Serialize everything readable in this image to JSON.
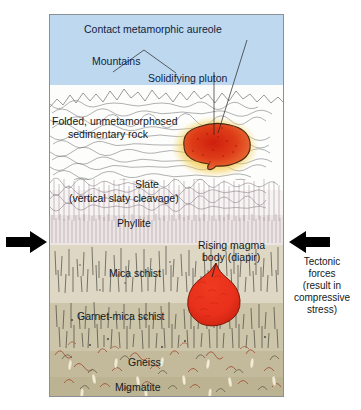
{
  "figure": {
    "type": "geology-cross-section",
    "title_present": false,
    "background_color": "#ffffff",
    "frame_color": "#8a8f96"
  },
  "colors": {
    "sky": "#bed9ef",
    "sedimentary": "#fdfdfb",
    "slate": "#f6f3f2",
    "phyllite": "#ece5e4",
    "mica_schist": "#ded7c4",
    "garnet_mica_schist": "#cdc5a9",
    "gneiss": "#c3ba9b",
    "migmatite": "#bcb392",
    "pluton_core": "#d62a16",
    "pluton_rim": "#e8642a",
    "aureole_halo": "#f2c230",
    "diapir": "#e8301b",
    "text": "#14181c",
    "label_blue": "#10233f",
    "arrow": "#000000"
  },
  "sky_labels": [
    {
      "id": "contact-aureole",
      "text": "Contact metamorphic aureole"
    },
    {
      "id": "mountains",
      "text": "Mountains"
    },
    {
      "id": "solidifying-pluton",
      "text": "Solidifying pluton"
    }
  ],
  "rock_labels": [
    {
      "id": "folded-sed-l1",
      "text": "Folded, unmetamorphosed"
    },
    {
      "id": "folded-sed-l2",
      "text": "sedimentary rock"
    },
    {
      "id": "slate",
      "text": "Slate"
    },
    {
      "id": "slaty-cleavage",
      "text": "(vertical slaty cleavage)"
    },
    {
      "id": "phyllite",
      "text": "Phyllite"
    },
    {
      "id": "mica-schist",
      "text": "Mica schist"
    },
    {
      "id": "garnet-mica-schist",
      "text": "Garnet-mica schist"
    },
    {
      "id": "gneiss",
      "text": "Gneiss"
    },
    {
      "id": "migmatite",
      "text": "Migmatite"
    }
  ],
  "magma_label": {
    "line1": "Rising magma",
    "line2": "body (diapir)"
  },
  "tectonic": {
    "line1": "Tectonic",
    "line2": "forces",
    "line3": "(result in",
    "line4": "compressive",
    "line5": "stress)"
  },
  "arrows": {
    "left": {
      "direction": "right",
      "name": "compression-arrow-left"
    },
    "right": {
      "direction": "left",
      "name": "compression-arrow-right"
    }
  }
}
